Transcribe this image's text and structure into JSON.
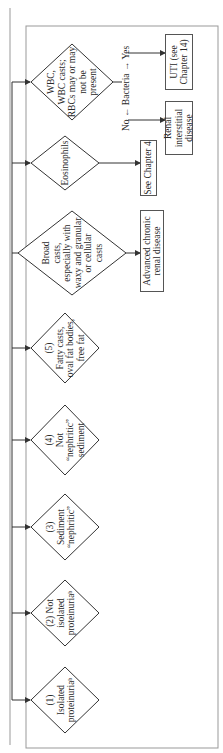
{
  "diamonds": [
    {
      "id": "isolated-proteinuria",
      "lines": [
        "(1)",
        "Isolated",
        "proteinuriaᵇ"
      ]
    },
    {
      "id": "not-isolated-proteinuria",
      "lines": [
        "(2) Not",
        "isolated",
        "proteinuriaᵇ"
      ]
    },
    {
      "id": "sediment-nephritic",
      "lines": [
        "(3)",
        "Sediment",
        "“nephritic”"
      ]
    },
    {
      "id": "not-nephritic-sediment",
      "lines": [
        "(4)",
        "Not",
        "“nephritic”",
        "sediment"
      ]
    },
    {
      "id": "fatty-casts",
      "lines": [
        "(5)",
        "Fatty casts,",
        "oval fat bodies,",
        "free fat"
      ]
    },
    {
      "id": "broad-casts",
      "lines": [
        "Broad",
        "casts,",
        "especially with",
        "waxy and granular",
        "or cellular",
        "casts"
      ]
    },
    {
      "id": "eosinophils",
      "lines": [
        "Eosinophils"
      ]
    },
    {
      "id": "wbc",
      "lines": [
        "WBC,",
        "WBC casts;",
        "RBCs may or may",
        "not be",
        "present"
      ]
    }
  ],
  "boxes": {
    "advanced_chronic": "Advanced chronic renal disease",
    "see_chapter_4": "See Chapter 4",
    "renal_interstitial": "Renal interstitial disease",
    "uti": "UTI (see Chapter 14)"
  },
  "bacteria": {
    "label": "Bacteria",
    "no": "No",
    "yes": "Yes"
  }
}
